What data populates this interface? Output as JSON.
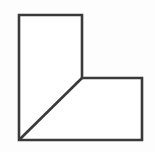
{
  "figure": {
    "name": "l-shaped-polygon-with-bevel",
    "canvas": {
      "width": 155,
      "height": 152,
      "background_color": "#fdfdfd"
    },
    "style": {
      "stroke_color": "#3a3a3a",
      "stroke_width": 2.6,
      "fill_color": "#ffffff",
      "line_join": "miter",
      "line_cap": "butt"
    },
    "vertices": [
      {
        "label": "top-left",
        "x": 19,
        "y": 15
      },
      {
        "label": "top-right",
        "x": 82,
        "y": 15
      },
      {
        "label": "inner-notch",
        "x": 82,
        "y": 78
      },
      {
        "label": "right-arm-top-right",
        "x": 142,
        "y": 78
      },
      {
        "label": "bottom-right",
        "x": 142,
        "y": 140
      },
      {
        "label": "bottom-left",
        "x": 19,
        "y": 140
      }
    ],
    "edges": [
      {
        "name": "top-edge",
        "from": "top-left",
        "to": "top-right",
        "orientation": "horizontal"
      },
      {
        "name": "upper-right-edge",
        "from": "top-right",
        "to": "inner-notch",
        "orientation": "vertical"
      },
      {
        "name": "notch-horizontal-edge",
        "from": "inner-notch",
        "to": "right-arm-top-right",
        "orientation": "horizontal"
      },
      {
        "name": "right-edge",
        "from": "right-arm-top-right",
        "to": "bottom-right",
        "orientation": "vertical"
      },
      {
        "name": "bottom-edge",
        "from": "bottom-right",
        "to": "bottom-left",
        "orientation": "horizontal"
      },
      {
        "name": "left-edge",
        "from": "bottom-left",
        "to": "top-left",
        "orientation": "vertical"
      },
      {
        "name": "diagonal-chamfer",
        "from": "bottom-left",
        "to": "inner-notch",
        "orientation": "diagonal-45"
      }
    ],
    "path_d": "M 19 15 L 82 15 L 82 78 L 142 78 L 142 140 L 19 140 Z",
    "diagonal_d": "M 19 140 L 82 78"
  }
}
